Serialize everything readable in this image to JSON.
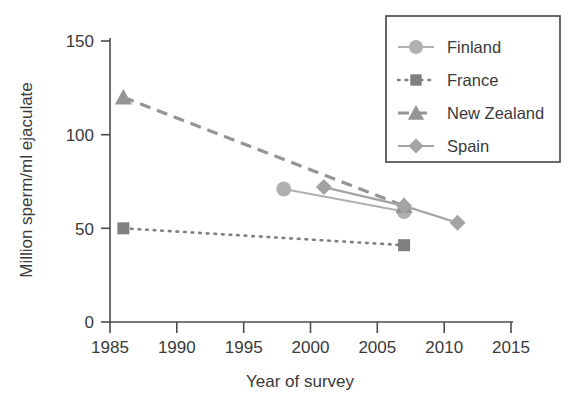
{
  "chart_data": {
    "type": "line",
    "title": "",
    "xlabel": "Year of survey",
    "ylabel": "Million sperm/ml ejaculate",
    "xlim": [
      1985,
      2015
    ],
    "ylim": [
      0,
      150
    ],
    "xticks": [
      1985,
      1990,
      1995,
      2000,
      2005,
      2010,
      2015
    ],
    "yticks": [
      0,
      50,
      100,
      150
    ],
    "grid": false,
    "legend_position": "top-right",
    "series": [
      {
        "name": "Finland",
        "marker": "circle",
        "linestyle": "solid",
        "color": "#b0b0b0",
        "x": [
          1998,
          2007
        ],
        "y": [
          71,
          59
        ]
      },
      {
        "name": "France",
        "marker": "square",
        "linestyle": "dotted",
        "color": "#7f7f7f",
        "x": [
          1986,
          2007
        ],
        "y": [
          50,
          41
        ]
      },
      {
        "name": "New Zealand",
        "marker": "triangle",
        "linestyle": "dashed",
        "color": "#959595",
        "x": [
          1986,
          2007
        ],
        "y": [
          120,
          62
        ]
      },
      {
        "name": "Spain",
        "marker": "diamond",
        "linestyle": "solid",
        "color": "#a3a3a3",
        "x": [
          2001,
          2007,
          2011
        ],
        "y": [
          72,
          62,
          53
        ]
      }
    ]
  },
  "axes": {
    "x_tick_labels": [
      "1985",
      "1990",
      "1995",
      "2000",
      "2005",
      "2010",
      "2015"
    ],
    "y_tick_labels": [
      "0",
      "50",
      "100",
      "150"
    ],
    "x_axis_title": "Year of survey",
    "y_axis_title": "Million sperm/ml ejaculate"
  },
  "legend": {
    "entries": [
      {
        "label": "Finland",
        "marker": "circle-marker-icon",
        "color": "#b0b0b0"
      },
      {
        "label": "France",
        "marker": "square-marker-icon",
        "color": "#7f7f7f"
      },
      {
        "label": "New Zealand",
        "marker": "triangle-marker-icon",
        "color": "#959595"
      },
      {
        "label": "Spain",
        "marker": "diamond-marker-icon",
        "color": "#a3a3a3"
      }
    ]
  },
  "colors": {
    "axis": "#4d4d4d",
    "text": "#3a3a3a",
    "legend_border": "#4d4d4d",
    "background": "#ffffff"
  }
}
